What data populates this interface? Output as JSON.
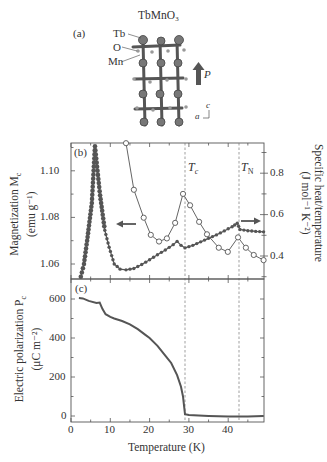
{
  "figure": {
    "panel_a": {
      "label": "(a)",
      "title": "TbMnO₃",
      "atoms": [
        "Tb",
        "O",
        "Mn"
      ],
      "polarization_arrow_label": "P",
      "axes_labels": {
        "c": "c",
        "a": "a"
      }
    },
    "panel_b": {
      "label": "(b)",
      "tc_label": "Tᴄ",
      "tc_text": "T",
      "tc_sub": "c",
      "tn_text": "T",
      "tn_sub": "N",
      "left_ylabel_line1": "Magnetization M",
      "left_ylabel_sub": "c",
      "left_ylabel_line2": "(emu g⁻¹)",
      "right_ylabel_line1": "Specific heat/temperature",
      "right_ylabel_line2": "(J mol⁻¹ K⁻²)",
      "left_ticks": [
        "1.10",
        "1.08",
        "1.06"
      ],
      "right_ticks": [
        "0.8",
        "0.6",
        "0.4"
      ]
    },
    "panel_c": {
      "label": "(c)",
      "ylabel_line1": "Electric polarization P",
      "ylabel_sub": "c",
      "ylabel_line2": "(μC m⁻²)",
      "y_ticks": [
        "600",
        "400",
        "200",
        "0"
      ],
      "x_ticks": [
        "0",
        "10",
        "20",
        "30",
        "40"
      ],
      "xlabel": "Temperature (K)"
    }
  },
  "chart_data": [
    {
      "type": "line",
      "title": "(b) Magnetization and specific heat of TbMnO3",
      "xlabel": "Temperature (K)",
      "xlim": [
        0,
        49
      ],
      "annotations": [
        {
          "text": "Tc",
          "x": 29
        },
        {
          "text": "TN",
          "x": 42.5
        },
        {
          "text": "← arrow: filled points use left axis (Magnetization)"
        },
        {
          "text": "→ arrow: open points use right axis (Specific heat/temperature)"
        }
      ],
      "series": [
        {
          "name": "Magnetization M_c (emu g^-1)",
          "axis": "left",
          "marker": "filled circle",
          "ylim": [
            1.0535,
            1.112
          ],
          "x": [
            2.5,
            3.3,
            4.1,
            5.3,
            6.1,
            7.4,
            8.6,
            9.7,
            11,
            12.5,
            14,
            16,
            18,
            20,
            22,
            24,
            26,
            27,
            28,
            29,
            31,
            33,
            35,
            37,
            39,
            41,
            42.3,
            43,
            45,
            47,
            49
          ],
          "values": [
            1.0545,
            1.06,
            1.07,
            1.0862,
            1.1105,
            1.0895,
            1.0745,
            1.0672,
            1.06,
            1.0578,
            1.0575,
            1.0581,
            1.0598,
            1.0618,
            1.064,
            1.066,
            1.0683,
            1.0697,
            1.068,
            1.0669,
            1.068,
            1.0695,
            1.071,
            1.0725,
            1.0742,
            1.076,
            1.0775,
            1.0748,
            1.0743,
            1.074,
            1.0738
          ]
        },
        {
          "name": "Specific heat/temperature (J mol^-1 K^-2)",
          "axis": "right",
          "marker": "open circle",
          "ylim": [
            0.29,
            0.945
          ],
          "x": [
            14,
            16,
            18.5,
            20.3,
            22.4,
            24.4,
            26.5,
            28.5,
            30.3,
            32.6,
            34.6,
            37.6,
            39.9,
            42.5,
            44.5,
            46.5,
            49
          ],
          "values": [
            0.945,
            0.72,
            0.585,
            0.502,
            0.47,
            0.485,
            0.56,
            0.7,
            0.645,
            0.565,
            0.505,
            0.44,
            0.42,
            0.49,
            0.44,
            0.405,
            0.38
          ]
        }
      ],
      "left_ylabel": "Magnetization M_c (emu g^-1)",
      "right_ylabel": "Specific heat/temperature (J mol^-1 K^-2)",
      "left_ticks": [
        1.06,
        1.08,
        1.1
      ],
      "right_ticks": [
        0.4,
        0.6,
        0.8
      ],
      "grid": false
    },
    {
      "type": "line",
      "title": "(c) Electric polarization",
      "xlabel": "Temperature (K)",
      "ylabel": "Electric polarization P_c (μC m^-2)",
      "xlim": [
        0,
        49
      ],
      "ylim": [
        -30,
        650
      ],
      "x_ticks": [
        0,
        10,
        20,
        30,
        40
      ],
      "y_ticks": [
        0,
        200,
        400,
        600
      ],
      "grid": false,
      "annotations": [
        {
          "text": "Tc",
          "x": 29
        },
        {
          "text": "TN",
          "x": 42.5
        }
      ],
      "series": [
        {
          "name": "P_c",
          "x": [
            2,
            3,
            4.5,
            6.5,
            7.3,
            8.0,
            8.8,
            10,
            11,
            13,
            15,
            17,
            19,
            20,
            22,
            24,
            25.5,
            27,
            28,
            28.5,
            28.8,
            29,
            30,
            35,
            40,
            45,
            49
          ],
          "values": [
            605,
            603,
            590,
            580,
            582,
            550,
            522,
            508,
            500,
            487,
            470,
            445,
            415,
            400,
            360,
            310,
            272,
            210,
            150,
            100,
            45,
            10,
            5,
            0,
            -3,
            -3,
            0
          ]
        }
      ]
    }
  ]
}
